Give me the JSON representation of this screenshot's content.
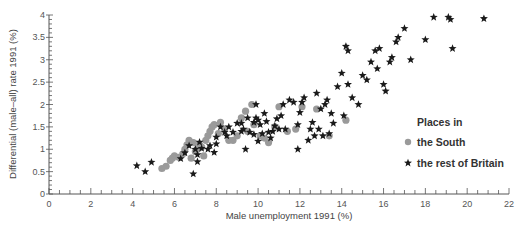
{
  "colors": {
    "south": "#9a9a9a",
    "rest": "#1a1a1a",
    "axis": "#555555",
    "text": "#444444"
  },
  "legend": {
    "title": "Places in",
    "items": [
      {
        "label": "the South",
        "marker": "circle"
      },
      {
        "label": "the rest of Britain",
        "marker": "star"
      }
    ]
  },
  "chart_data": {
    "type": "scatter",
    "title": "",
    "xlabel": "Male unemployment  1991 (%)",
    "ylabel": "Differential (male–all) rate 1991 (%)",
    "xlim": [
      0,
      22
    ],
    "ylim": [
      0,
      4
    ],
    "xticks": [
      0,
      2,
      4,
      6,
      8,
      10,
      12,
      14,
      16,
      18,
      20,
      22
    ],
    "yticks": [
      0,
      0.5,
      1,
      1.5,
      2,
      2.5,
      3,
      3.5,
      4
    ],
    "xtick_labels": [
      "0",
      "2",
      "4",
      "6",
      "8",
      "10",
      "12",
      "14",
      "16",
      "18",
      "20",
      "22"
    ],
    "ytick_labels": [
      "0",
      "0.5",
      "1",
      "1.5",
      "2",
      "2.5",
      "3",
      "3.5",
      "4"
    ],
    "grid": false,
    "legend_position": "right-center",
    "series": [
      {
        "name": "the South",
        "marker": "circle",
        "points": [
          [
            5.4,
            0.57
          ],
          [
            5.6,
            0.62
          ],
          [
            5.8,
            0.75
          ],
          [
            5.9,
            0.8
          ],
          [
            6.0,
            0.85
          ],
          [
            6.2,
            0.82
          ],
          [
            6.4,
            0.9
          ],
          [
            6.5,
            1.0
          ],
          [
            6.6,
            1.1
          ],
          [
            6.7,
            1.2
          ],
          [
            6.8,
            0.8
          ],
          [
            6.9,
            1.15
          ],
          [
            7.0,
            0.95
          ],
          [
            7.1,
            1.0
          ],
          [
            7.2,
            1.1
          ],
          [
            7.3,
            1.05
          ],
          [
            7.4,
            0.85
          ],
          [
            7.5,
            1.2
          ],
          [
            7.6,
            1.3
          ],
          [
            7.7,
            1.4
          ],
          [
            7.8,
            1.5
          ],
          [
            7.9,
            1.55
          ],
          [
            8.1,
            1.35
          ],
          [
            8.2,
            1.6
          ],
          [
            8.4,
            1.45
          ],
          [
            8.6,
            1.2
          ],
          [
            8.8,
            1.2
          ],
          [
            9.0,
            1.3
          ],
          [
            9.2,
            1.7
          ],
          [
            9.4,
            1.85
          ],
          [
            9.5,
            1.4
          ],
          [
            9.7,
            2.0
          ],
          [
            9.8,
            1.55
          ],
          [
            10.1,
            1.3
          ],
          [
            10.3,
            1.25
          ],
          [
            10.5,
            1.15
          ],
          [
            10.8,
            1.5
          ],
          [
            11.0,
            1.95
          ],
          [
            11.4,
            1.4
          ],
          [
            11.8,
            1.45
          ],
          [
            12.1,
            1.95
          ],
          [
            12.8,
            1.9
          ],
          [
            13.4,
            1.3
          ],
          [
            14.2,
            1.65
          ]
        ]
      },
      {
        "name": "the rest of Britain",
        "marker": "star",
        "points": [
          [
            4.2,
            0.63
          ],
          [
            4.6,
            0.5
          ],
          [
            4.9,
            0.71
          ],
          [
            6.3,
            0.79
          ],
          [
            6.5,
            0.92
          ],
          [
            6.7,
            1.08
          ],
          [
            6.9,
            0.45
          ],
          [
            7.0,
            1.0
          ],
          [
            7.1,
            0.72
          ],
          [
            7.1,
            0.88
          ],
          [
            7.2,
            1.16
          ],
          [
            7.3,
            1.02
          ],
          [
            7.6,
            1.0
          ],
          [
            7.7,
            1.08
          ],
          [
            7.9,
            0.93
          ],
          [
            8.0,
            1.12
          ],
          [
            8.0,
            1.27
          ],
          [
            8.2,
            1.5
          ],
          [
            8.4,
            1.38
          ],
          [
            8.5,
            1.3
          ],
          [
            8.6,
            1.5
          ],
          [
            8.8,
            1.38
          ],
          [
            9.0,
            1.58
          ],
          [
            9.2,
            1.58
          ],
          [
            9.2,
            1.4
          ],
          [
            9.3,
            1.45
          ],
          [
            9.4,
            1.0
          ],
          [
            9.5,
            1.7
          ],
          [
            9.6,
            1.38
          ],
          [
            9.8,
            1.33
          ],
          [
            9.8,
            1.6
          ],
          [
            9.9,
            1.7
          ],
          [
            9.9,
            2.0
          ],
          [
            10.0,
            1.18
          ],
          [
            10.0,
            1.65
          ],
          [
            10.1,
            1.55
          ],
          [
            10.2,
            1.35
          ],
          [
            10.3,
            1.8
          ],
          [
            10.4,
            1.62
          ],
          [
            10.5,
            1.38
          ],
          [
            10.6,
            1.25
          ],
          [
            10.7,
            1.4
          ],
          [
            10.8,
            1.52
          ],
          [
            10.9,
            1.68
          ],
          [
            11.0,
            1.45
          ],
          [
            11.1,
            1.75
          ],
          [
            11.2,
            2.0
          ],
          [
            11.3,
            1.45
          ],
          [
            11.5,
            2.1
          ],
          [
            11.7,
            2.05
          ],
          [
            11.9,
            1.55
          ],
          [
            11.9,
            1.0
          ],
          [
            12.0,
            1.82
          ],
          [
            12.1,
            2.05
          ],
          [
            12.2,
            2.15
          ],
          [
            12.4,
            1.2
          ],
          [
            12.5,
            1.45
          ],
          [
            12.6,
            1.6
          ],
          [
            12.7,
            1.3
          ],
          [
            12.8,
            2.25
          ],
          [
            12.9,
            1.45
          ],
          [
            13.0,
            1.9
          ],
          [
            13.1,
            1.3
          ],
          [
            13.2,
            2.0
          ],
          [
            13.3,
            2.1
          ],
          [
            13.4,
            1.35
          ],
          [
            13.5,
            1.8
          ],
          [
            13.6,
            1.58
          ],
          [
            13.8,
            2.4
          ],
          [
            14.0,
            2.7
          ],
          [
            14.1,
            1.75
          ],
          [
            14.2,
            3.3
          ],
          [
            14.3,
            3.2
          ],
          [
            14.3,
            2.45
          ],
          [
            14.5,
            2.15
          ],
          [
            14.8,
            2.0
          ],
          [
            15.0,
            2.65
          ],
          [
            15.2,
            2.55
          ],
          [
            15.4,
            2.95
          ],
          [
            15.6,
            3.2
          ],
          [
            15.7,
            2.8
          ],
          [
            15.8,
            3.25
          ],
          [
            16.0,
            2.45
          ],
          [
            16.1,
            2.3
          ],
          [
            16.3,
            2.95
          ],
          [
            16.4,
            3.05
          ],
          [
            16.6,
            3.4
          ],
          [
            16.7,
            3.5
          ],
          [
            17.0,
            3.7
          ],
          [
            17.3,
            3.0
          ],
          [
            18.0,
            3.45
          ],
          [
            18.4,
            3.95
          ],
          [
            19.1,
            3.95
          ],
          [
            19.2,
            3.9
          ],
          [
            19.3,
            3.25
          ],
          [
            20.8,
            3.92
          ]
        ]
      }
    ]
  }
}
